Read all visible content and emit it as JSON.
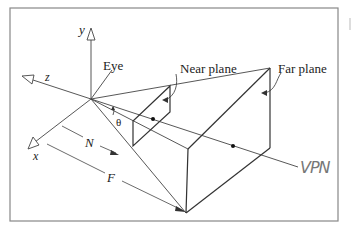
{
  "figure": {
    "type": "perspective view frustum",
    "labels": {
      "y_axis": "y",
      "z_axis": "z",
      "x_axis": "x",
      "eye": "Eye",
      "near_plane": "Near plane",
      "far_plane": "Far plane",
      "angle": "θ",
      "near_distance": "N",
      "far_distance": "F",
      "vpn": "VPN"
    },
    "colors": {
      "line": "#333333",
      "frame": "#888888",
      "handwriting": "#777777",
      "background": "#ffffff"
    }
  }
}
